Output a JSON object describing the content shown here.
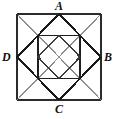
{
  "figure": {
    "kind": "geometric-line-diagram",
    "background_color": "#ffffff",
    "stroke_color_dark": "#1a1a1a",
    "stroke_color_mid": "#555555",
    "stroke_color_light": "#9a9a9a",
    "labels": [
      {
        "id": "A",
        "text": "A",
        "position": "top"
      },
      {
        "id": "B",
        "text": "B",
        "position": "right"
      },
      {
        "id": "C",
        "text": "C",
        "position": "bottom"
      },
      {
        "id": "D",
        "text": "D",
        "position": "left"
      }
    ],
    "points": {
      "outer_top_left": [
        17,
        14
      ],
      "outer_top_right": [
        101,
        14
      ],
      "outer_bottom_right": [
        101,
        100
      ],
      "outer_bottom_left": [
        17,
        100
      ],
      "A": [
        59,
        14
      ],
      "B": [
        101,
        57
      ],
      "C": [
        59,
        100
      ],
      "D": [
        17,
        57
      ],
      "center": [
        59,
        57
      ],
      "inner_top_left": [
        38,
        35.5
      ],
      "inner_top_right": [
        80,
        35.5
      ],
      "inner_bottom_right": [
        80,
        78.5
      ],
      "inner_bottom_left": [
        38,
        78.5
      ],
      "inner_diamond_top": [
        59,
        35.5
      ],
      "inner_diamond_right": [
        80,
        57
      ],
      "inner_diamond_bottom": [
        59,
        78.5
      ],
      "inner_diamond_left": [
        38,
        57
      ]
    }
  }
}
